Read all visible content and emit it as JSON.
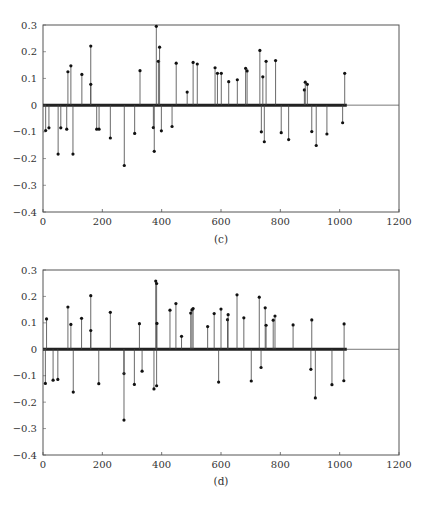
{
  "figure": {
    "background": "#ffffff",
    "stem_color": "#444444",
    "marker_color": "#111111",
    "baseline_color": "#222222",
    "frame_color": "#555555"
  },
  "chart_data": [
    {
      "type": "stem",
      "caption": "(c)",
      "title": "",
      "xlabel": "",
      "ylabel": "",
      "xlim": [
        0,
        1200
      ],
      "ylim": [
        -0.4,
        0.3
      ],
      "xticks": [
        0,
        200,
        400,
        600,
        800,
        1000,
        1200
      ],
      "xtick_labels": [
        "0",
        "200",
        "400",
        "600",
        "800",
        "1000",
        "1200"
      ],
      "yticks": [
        0.3,
        0.2,
        0.1,
        0,
        -0.1,
        -0.2,
        -0.3,
        -0.4
      ],
      "ytick_labels": [
        "0.3",
        "0.2",
        "0.1",
        "0",
        "−0.1",
        "−0.2",
        "−0.3",
        "−0.4"
      ],
      "grid": false,
      "legend": null,
      "n_samples": 1024,
      "note": "Sparse stem plot; all samples in 0..1023 not listed are zero (thick baseline)",
      "points": [
        [
          9,
          -0.095
        ],
        [
          20,
          -0.085
        ],
        [
          51,
          -0.183
        ],
        [
          60,
          -0.085
        ],
        [
          80,
          -0.09
        ],
        [
          84,
          0.125
        ],
        [
          94,
          0.147
        ],
        [
          101,
          -0.183
        ],
        [
          131,
          0.115
        ],
        [
          161,
          0.221
        ],
        [
          161,
          0.078
        ],
        [
          181,
          -0.09
        ],
        [
          189,
          -0.09
        ],
        [
          227,
          -0.123
        ],
        [
          274,
          -0.226
        ],
        [
          309,
          -0.106
        ],
        [
          327,
          0.129
        ],
        [
          372,
          -0.084
        ],
        [
          375,
          -0.173
        ],
        [
          382,
          0.295
        ],
        [
          389,
          0.164
        ],
        [
          393,
          0.217
        ],
        [
          399,
          -0.096
        ],
        [
          435,
          -0.08
        ],
        [
          449,
          0.157
        ],
        [
          486,
          0.049
        ],
        [
          506,
          0.16
        ],
        [
          520,
          0.154
        ],
        [
          580,
          0.14
        ],
        [
          588,
          0.119
        ],
        [
          601,
          0.119
        ],
        [
          626,
          0.088
        ],
        [
          655,
          0.095
        ],
        [
          683,
          0.138
        ],
        [
          688,
          0.128
        ],
        [
          731,
          0.205
        ],
        [
          736,
          -0.1
        ],
        [
          741,
          0.106
        ],
        [
          746,
          -0.137
        ],
        [
          752,
          0.164
        ],
        [
          784,
          0.167
        ],
        [
          803,
          -0.103
        ],
        [
          828,
          -0.129
        ],
        [
          881,
          0.057
        ],
        [
          884,
          0.086
        ],
        [
          891,
          0.078
        ],
        [
          906,
          -0.099
        ],
        [
          921,
          -0.151
        ],
        [
          957,
          -0.108
        ],
        [
          1010,
          -0.066
        ],
        [
          1017,
          0.119
        ]
      ]
    },
    {
      "type": "stem",
      "caption": "(d)",
      "title": "",
      "xlabel": "",
      "ylabel": "",
      "xlim": [
        0,
        1200
      ],
      "ylim": [
        -0.4,
        0.3
      ],
      "xticks": [
        0,
        200,
        400,
        600,
        800,
        1000,
        1200
      ],
      "xtick_labels": [
        "0",
        "200",
        "400",
        "600",
        "800",
        "1000",
        "1200"
      ],
      "yticks": [
        0.3,
        0.2,
        0.1,
        0,
        -0.1,
        -0.2,
        -0.3,
        -0.4
      ],
      "ytick_labels": [
        "0.3",
        "0.2",
        "0.1",
        "0",
        "−0.1",
        "−0.2",
        "−0.3",
        "−0.4"
      ],
      "grid": false,
      "legend": null,
      "n_samples": 1024,
      "note": "Sparse stem plot; all samples in 0..1023 not listed are zero (thick baseline)",
      "points": [
        [
          8,
          -0.129
        ],
        [
          12,
          0.115
        ],
        [
          34,
          -0.117
        ],
        [
          50,
          -0.114
        ],
        [
          84,
          0.16
        ],
        [
          94,
          0.094
        ],
        [
          102,
          -0.162
        ],
        [
          130,
          0.117
        ],
        [
          161,
          0.203
        ],
        [
          161,
          0.071
        ],
        [
          188,
          -0.13
        ],
        [
          227,
          0.14
        ],
        [
          273,
          -0.092
        ],
        [
          273,
          -0.268
        ],
        [
          308,
          -0.133
        ],
        [
          325,
          0.097
        ],
        [
          334,
          -0.083
        ],
        [
          374,
          -0.15
        ],
        [
          380,
          0.258
        ],
        [
          383,
          0.249
        ],
        [
          384,
          0.098
        ],
        [
          383,
          -0.138
        ],
        [
          428,
          0.148
        ],
        [
          448,
          0.173
        ],
        [
          467,
          0.049
        ],
        [
          498,
          0.137
        ],
        [
          502,
          0.149
        ],
        [
          506,
          0.154
        ],
        [
          555,
          0.086
        ],
        [
          577,
          0.135
        ],
        [
          592,
          -0.124
        ],
        [
          600,
          0.152
        ],
        [
          622,
          0.112
        ],
        [
          624,
          0.131
        ],
        [
          654,
          0.206
        ],
        [
          677,
          0.119
        ],
        [
          702,
          -0.12
        ],
        [
          729,
          0.197
        ],
        [
          735,
          -0.069
        ],
        [
          749,
          0.157
        ],
        [
          752,
          0.091
        ],
        [
          776,
          0.11
        ],
        [
          782,
          0.126
        ],
        [
          843,
          0.092
        ],
        [
          903,
          -0.076
        ],
        [
          906,
          0.111
        ],
        [
          918,
          -0.184
        ],
        [
          974,
          -0.134
        ],
        [
          1014,
          -0.119
        ],
        [
          1015,
          0.096
        ]
      ]
    }
  ],
  "layout": {
    "panels": [
      {
        "left": 43,
        "right": 399,
        "top": 25,
        "bottom": 212,
        "caption_y": 243
      },
      {
        "left": 43,
        "right": 399,
        "top": 270,
        "bottom": 455,
        "caption_y": 485
      }
    ]
  }
}
